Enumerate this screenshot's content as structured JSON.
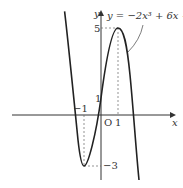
{
  "diagram": {
    "function_label": "y = −2x³ + 6x + 1",
    "axes": {
      "x_label": "x",
      "y_label": "y",
      "origin_label": "O"
    },
    "ticks": {
      "x_neg1": "−1",
      "x_pos1": "1",
      "y_pos1": "1",
      "y_max": "5",
      "y_min": "−3"
    },
    "key_points": [
      {
        "name": "local-max",
        "x": 1,
        "y": 5
      },
      {
        "name": "local-min",
        "x": -1,
        "y": -3
      },
      {
        "name": "y-intercept",
        "x": 0,
        "y": 1
      }
    ],
    "colors": {
      "curve": "#222222",
      "axis": "#333333",
      "dashed": "#666666"
    }
  }
}
